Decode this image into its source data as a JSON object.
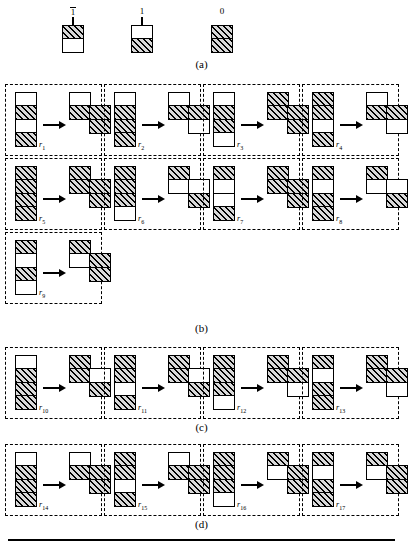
{
  "figure": {
    "captions": {
      "a": "(a)",
      "b": "(b)",
      "c": "(c)",
      "d": "(d)"
    }
  },
  "legend": {
    "title_symbols": [
      {
        "name": "symbol-minus-one",
        "label": "1",
        "overline": true,
        "stem": true,
        "cells": [
          "hatched",
          "white"
        ]
      },
      {
        "name": "symbol-one",
        "label": "1",
        "overline": false,
        "stem": true,
        "cells": [
          "white",
          "hatched"
        ]
      },
      {
        "name": "symbol-zero",
        "label": "0",
        "overline": false,
        "stem": false,
        "cells": [
          "hatched",
          "hatched"
        ]
      }
    ]
  },
  "sections": {
    "b": {
      "caption": "(b)",
      "rules": [
        {
          "id": "r1",
          "label": "r",
          "sub": "1",
          "lhs": [
            "white",
            "hatched",
            "white",
            "hatched"
          ],
          "rhs_left": [
            "white",
            "hatched"
          ],
          "rhs_right": [
            "hatched",
            "hatched"
          ],
          "offset": 15
        },
        {
          "id": "r2",
          "label": "r",
          "sub": "2",
          "lhs": [
            "white",
            "hatched",
            "hatched",
            "hatched"
          ],
          "rhs_left": [
            "white",
            "hatched"
          ],
          "rhs_right": [
            "hatched",
            "white"
          ],
          "offset": 15
        },
        {
          "id": "r3",
          "label": "r",
          "sub": "3",
          "lhs": [
            "white",
            "hatched",
            "hatched",
            "white"
          ],
          "rhs_left": [
            "hatched",
            "hatched"
          ],
          "rhs_right": [
            "hatched",
            "hatched"
          ],
          "offset": 15
        },
        {
          "id": "r4",
          "label": "r",
          "sub": "4",
          "lhs": [
            "hatched",
            "hatched",
            "white",
            "hatched"
          ],
          "rhs_left": [
            "white",
            "hatched"
          ],
          "rhs_right": [
            "hatched",
            "white"
          ],
          "offset": 15
        },
        {
          "id": "r5",
          "label": "r",
          "sub": "5",
          "lhs": [
            "hatched",
            "hatched",
            "hatched",
            "hatched"
          ],
          "rhs_left": [
            "hatched",
            "hatched"
          ],
          "rhs_right": [
            "hatched",
            "hatched"
          ],
          "offset": 15
        },
        {
          "id": "r6",
          "label": "r",
          "sub": "6",
          "lhs": [
            "hatched",
            "hatched",
            "hatched",
            "white"
          ],
          "rhs_left": [
            "hatched",
            "white"
          ],
          "rhs_right": [
            "white",
            "hatched"
          ],
          "offset": 15
        },
        {
          "id": "r7",
          "label": "r",
          "sub": "7",
          "lhs": [
            "hatched",
            "white",
            "white",
            "hatched"
          ],
          "rhs_left": [
            "hatched",
            "hatched"
          ],
          "rhs_right": [
            "hatched",
            "hatched"
          ],
          "offset": 15
        },
        {
          "id": "r8",
          "label": "r",
          "sub": "8",
          "lhs": [
            "hatched",
            "white",
            "hatched",
            "hatched"
          ],
          "rhs_left": [
            "hatched",
            "white"
          ],
          "rhs_right": [
            "white",
            "hatched"
          ],
          "offset": 15
        },
        {
          "id": "r9",
          "label": "r",
          "sub": "9",
          "lhs": [
            "hatched",
            "white",
            "hatched",
            "white"
          ],
          "rhs_left": [
            "hatched",
            "white"
          ],
          "rhs_right": [
            "hatched",
            "hatched"
          ],
          "offset": 15
        }
      ]
    },
    "c": {
      "caption": "(c)",
      "rules": [
        {
          "id": "r10",
          "label": "r",
          "sub": "10",
          "lhs": [
            "white",
            "hatched",
            "hatched",
            "hatched"
          ],
          "rhs_left": [
            "hatched",
            "hatched"
          ],
          "rhs_right": [
            "white",
            "hatched"
          ],
          "offset": 15
        },
        {
          "id": "r11",
          "label": "r",
          "sub": "11",
          "lhs": [
            "hatched",
            "hatched",
            "white",
            "hatched"
          ],
          "rhs_left": [
            "hatched",
            "hatched"
          ],
          "rhs_right": [
            "white",
            "hatched"
          ],
          "offset": 15
        },
        {
          "id": "r12",
          "label": "r",
          "sub": "12",
          "lhs": [
            "hatched",
            "hatched",
            "hatched",
            "white"
          ],
          "rhs_left": [
            "hatched",
            "hatched"
          ],
          "rhs_right": [
            "hatched",
            "white"
          ],
          "offset": 15
        },
        {
          "id": "r13",
          "label": "r",
          "sub": "13",
          "lhs": [
            "hatched",
            "white",
            "hatched",
            "hatched"
          ],
          "rhs_left": [
            "hatched",
            "hatched"
          ],
          "rhs_right": [
            "hatched",
            "white"
          ],
          "offset": 15
        }
      ]
    },
    "d": {
      "caption": "(d)",
      "rules": [
        {
          "id": "r14",
          "label": "r",
          "sub": "14",
          "lhs": [
            "white",
            "hatched",
            "hatched",
            "hatched"
          ],
          "rhs_left": [
            "white",
            "hatched"
          ],
          "rhs_right": [
            "hatched",
            "hatched"
          ],
          "offset": 15
        },
        {
          "id": "r15",
          "label": "r",
          "sub": "15",
          "lhs": [
            "hatched",
            "hatched",
            "white",
            "hatched"
          ],
          "rhs_left": [
            "white",
            "hatched"
          ],
          "rhs_right": [
            "hatched",
            "hatched"
          ],
          "offset": 15
        },
        {
          "id": "r16",
          "label": "r",
          "sub": "16",
          "lhs": [
            "hatched",
            "hatched",
            "hatched",
            "white"
          ],
          "rhs_left": [
            "hatched",
            "white"
          ],
          "rhs_right": [
            "hatched",
            "hatched"
          ],
          "offset": 15
        },
        {
          "id": "r17",
          "label": "r",
          "sub": "17",
          "lhs": [
            "hatched",
            "white",
            "hatched",
            "hatched"
          ],
          "rhs_left": [
            "hatched",
            "white"
          ],
          "rhs_right": [
            "hatched",
            "hatched"
          ],
          "offset": 15
        }
      ]
    }
  }
}
